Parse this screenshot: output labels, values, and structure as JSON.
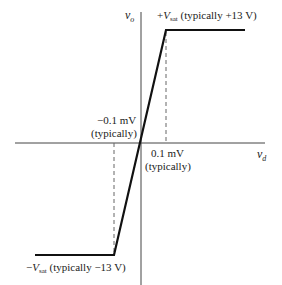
{
  "diagram": {
    "axes": {
      "y_label_var": "v",
      "y_label_sub": "o",
      "x_label_var": "v",
      "x_label_sub": "d"
    },
    "labels": {
      "pos_sat_sign": "+",
      "pos_sat_var": "V",
      "pos_sat_sub": "sat",
      "pos_sat_text": " (typically +13 V)",
      "neg_sat_sign": "−",
      "neg_sat_var": "V",
      "neg_sat_sub": "sat",
      "neg_sat_text": " (typically −13 V)",
      "neg_threshold_value": "−0.1 mV",
      "neg_threshold_note": "(typically)",
      "pos_threshold_value": "0.1 mV",
      "pos_threshold_note": "(typically)"
    },
    "values": {
      "pos_saturation_V": 13,
      "neg_saturation_V": -13,
      "pos_threshold_mV": 0.1,
      "neg_threshold_mV": -0.1
    },
    "colors": {
      "curve": "#111111",
      "axis": "#444444",
      "dashed": "#666666"
    }
  }
}
